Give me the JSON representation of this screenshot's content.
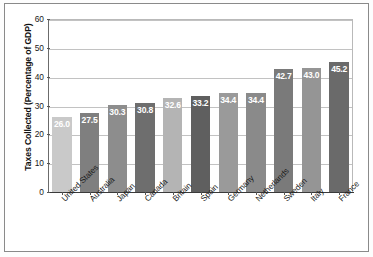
{
  "chart_data": {
    "type": "bar",
    "title": "",
    "xlabel": "",
    "ylabel": "Taxes Collected (Percentage of GDP)",
    "ylim": [
      0,
      60
    ],
    "yticks": [
      0,
      10,
      20,
      30,
      40,
      50,
      60
    ],
    "grid": true,
    "legend": "none",
    "categories": [
      "United States",
      "Australia",
      "Japan",
      "Canada",
      "Britain",
      "Spain",
      "Germany",
      "Netherlands",
      "Sweden",
      "Italy",
      "France"
    ],
    "values": [
      26.0,
      27.5,
      30.3,
      30.8,
      32.6,
      33.2,
      34.4,
      34.4,
      42.7,
      43.0,
      45.2
    ],
    "value_labels": [
      "26.0",
      "27.5",
      "30.3",
      "30.8",
      "32.6",
      "33.2",
      "34.4",
      "34.4",
      "42.7",
      "43.0",
      "45.2"
    ],
    "bar_colors": [
      "#c9c9c9",
      "#7f7f7f",
      "#8d8d8d",
      "#6e6e6e",
      "#b4b4b4",
      "#5f5f5f",
      "#9a9a9a",
      "#8a8a8a",
      "#7a7a7a",
      "#959595",
      "#6a6a6a"
    ],
    "ytick_labels": [
      "0",
      "10",
      "20",
      "30",
      "40",
      "50",
      "60"
    ]
  }
}
